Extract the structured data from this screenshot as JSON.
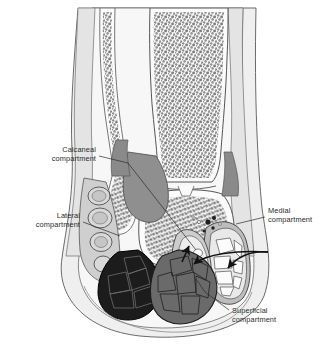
{
  "figure": {
    "background_color": "#ffffff",
    "watermark": ""
  },
  "palette": {
    "skin_outline": "#5a5a5a",
    "subcutaneous_fat": "#ededed",
    "soft_tissue": "#e2e2e2",
    "deep_fascia_gray": "#9a9a9a",
    "muscle_mid_gray": "#7d7d7d",
    "muscle_dark": "#1c1c1c",
    "muscle_medium": "#6a6a6a",
    "bone_cortex": "#fbfbfb",
    "trabecular_bone": "#8a8a8a",
    "label_text": "#2b2b2b",
    "leader_line": "#2b2b2b",
    "arrowhead": "#111111"
  },
  "labels": [
    {
      "id": "calcaneal",
      "line1": "Calcaneal",
      "line2": "compartment",
      "align": "right",
      "text_x": 96,
      "text_y": 152,
      "leader": "M 99,156 L 128,163 L 196,250"
    },
    {
      "id": "lateral",
      "line1": "Lateral",
      "line2": "compartment",
      "align": "right",
      "text_x": 80,
      "text_y": 218,
      "leader": "M 83,222 L 120,236"
    },
    {
      "id": "medial",
      "line1": "Medial",
      "line2": "compartment",
      "align": "left",
      "text_x": 268,
      "text_y": 213,
      "leader": "M 265,217 L 236,224"
    },
    {
      "id": "superficial",
      "line1": "Superficial",
      "line2": "compartment",
      "align": "left",
      "text_x": 232,
      "text_y": 313,
      "leader": "M 229,310 L 205,292 L 196,279"
    }
  ],
  "anatomy": {
    "bones": [
      {
        "name": "fibula",
        "region": "lateral-leg"
      },
      {
        "name": "tibia",
        "region": "medial-leg"
      },
      {
        "name": "talus",
        "region": "hindfoot-superior"
      },
      {
        "name": "calcaneus",
        "region": "hindfoot-inferior"
      }
    ],
    "compartments": [
      {
        "name": "calcaneal-compartment"
      },
      {
        "name": "lateral-compartment"
      },
      {
        "name": "medial-compartment"
      },
      {
        "name": "superficial-compartment"
      }
    ]
  }
}
